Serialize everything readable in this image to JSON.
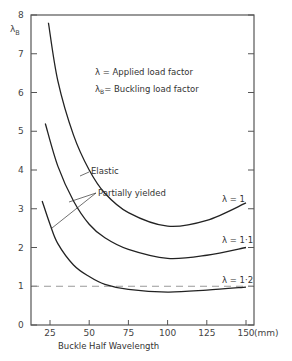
{
  "chart_data": {
    "type": "line",
    "title": "",
    "xlabel": "Buckle Half Wavelength",
    "x_unit": "(mm)",
    "ylabel": "λB",
    "xlim": [
      12,
      156
    ],
    "ylim": [
      0,
      8
    ],
    "xticks": [
      25,
      50,
      75,
      100,
      125,
      150
    ],
    "yticks": [
      0,
      1,
      2,
      3,
      4,
      5,
      6,
      7,
      8
    ],
    "grid": false,
    "legend_notes": [
      "λ = Applied load factor",
      "λB= Buckling load factor"
    ],
    "annotations": [
      "Elastic",
      "Partially yielded"
    ],
    "reference_line": {
      "y": 1,
      "style": "dashed"
    },
    "series": [
      {
        "name": "λ = 1",
        "x": [
          24,
          30,
          40,
          50,
          60,
          75,
          100,
          125,
          150
        ],
        "y": [
          7.8,
          6.3,
          4.9,
          4.0,
          3.4,
          2.9,
          2.55,
          2.7,
          3.15
        ]
      },
      {
        "name": "λ = 1·1",
        "x": [
          22,
          30,
          40,
          50,
          60,
          75,
          100,
          125,
          150
        ],
        "y": [
          5.2,
          4.1,
          3.2,
          2.6,
          2.25,
          1.95,
          1.72,
          1.8,
          2.0
        ]
      },
      {
        "name": "λ = 1·2",
        "x": [
          20,
          25,
          30,
          40,
          50,
          60,
          75,
          100,
          125,
          150
        ],
        "y": [
          3.2,
          2.6,
          2.1,
          1.55,
          1.25,
          1.05,
          0.92,
          0.85,
          0.9,
          0.98
        ]
      }
    ]
  },
  "labels": {
    "ylabel_main": "λ",
    "ylabel_sub": "B",
    "note1": "λ = Applied load factor",
    "note2_pre": "λ",
    "note2_sub": "B",
    "note2_post": "= Buckling load factor",
    "elastic": "Elastic",
    "partially_yielded": "Partially yielded",
    "series1": "λ = 1",
    "series2": "λ = 1·1",
    "series3": "λ = 1·2",
    "xlabel": "Buckle Half Wavelength",
    "x_unit": "(mm)"
  },
  "colors": {
    "line": "#222222",
    "axis": "#555555",
    "dash": "#999999"
  }
}
